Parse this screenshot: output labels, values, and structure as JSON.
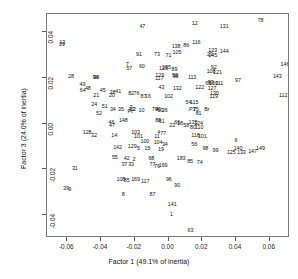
{
  "chart_data": {
    "type": "scatter",
    "title": "",
    "xlabel": "Factor 1 (49.1% of inertia)",
    "ylabel": "Factor 3 (24.0% of inertia)",
    "xlim": [
      -0.072,
      0.072
    ],
    "ylim": [
      -0.05,
      0.048
    ],
    "xticks": [
      "-0.06",
      "-0.04",
      "-0.02",
      "0.00",
      "0.02",
      "0.04",
      "0.06"
    ],
    "xtick_values": [
      -0.06,
      -0.04,
      -0.02,
      0.0,
      0.02,
      0.04,
      0.06
    ],
    "yticks": [
      "0.04",
      "0.02",
      "0.00",
      "-0.02",
      "-0.04"
    ],
    "ytick_values": [
      0.04,
      0.02,
      0.0,
      -0.02,
      -0.04
    ],
    "grid": false,
    "legend": "none",
    "marker": "text-label",
    "points": [
      {
        "label": "78",
        "x": 0.0545,
        "y": 0.045
      },
      {
        "label": "12",
        "x": 0.0155,
        "y": 0.0435
      },
      {
        "label": "131",
        "x": 0.033,
        "y": 0.0425
      },
      {
        "label": "47",
        "x": -0.0155,
        "y": 0.0425
      },
      {
        "label": "13",
        "x": -0.063,
        "y": 0.0355
      },
      {
        "label": "29",
        "x": -0.0632,
        "y": 0.0345
      },
      {
        "label": "116",
        "x": 0.0165,
        "y": 0.0355
      },
      {
        "label": "86",
        "x": 0.0105,
        "y": 0.034
      },
      {
        "label": "138",
        "x": 0.0045,
        "y": 0.0335
      },
      {
        "label": "105",
        "x": 0.005,
        "y": 0.031
      },
      {
        "label": "123",
        "x": 0.0262,
        "y": 0.032
      },
      {
        "label": "144",
        "x": 0.033,
        "y": 0.0315
      },
      {
        "label": "23",
        "x": 0.0245,
        "y": 0.03
      },
      {
        "label": "145",
        "x": 0.0262,
        "y": 0.0298
      },
      {
        "label": "91",
        "x": -0.0175,
        "y": 0.03
      },
      {
        "label": "73",
        "x": -0.0068,
        "y": 0.03
      },
      {
        "label": "71",
        "x": 0.0,
        "y": 0.0298
      },
      {
        "label": "146",
        "x": 0.069,
        "y": 0.0255
      },
      {
        "label": "7",
        "x": -0.0245,
        "y": 0.0255
      },
      {
        "label": "60",
        "x": -0.0158,
        "y": 0.025
      },
      {
        "label": "57",
        "x": -0.0232,
        "y": 0.0238
      },
      {
        "label": "125",
        "x": -0.003,
        "y": 0.0238
      },
      {
        "label": "135",
        "x": -0.0012,
        "y": 0.0245
      },
      {
        "label": "89",
        "x": 0.0035,
        "y": 0.0235
      },
      {
        "label": "92",
        "x": 0.0268,
        "y": 0.0242
      },
      {
        "label": "108",
        "x": 0.0252,
        "y": 0.0228
      },
      {
        "label": "121",
        "x": 0.029,
        "y": 0.022
      },
      {
        "label": "28",
        "x": -0.0578,
        "y": 0.0205
      },
      {
        "label": "143",
        "x": 0.0645,
        "y": 0.0205
      },
      {
        "label": "129",
        "x": -0.0052,
        "y": 0.0208
      },
      {
        "label": "117",
        "x": -0.0055,
        "y": 0.0195
      },
      {
        "label": "98",
        "x": 0.0042,
        "y": 0.0205
      },
      {
        "label": "50",
        "x": 0.0038,
        "y": 0.0208
      },
      {
        "label": "113",
        "x": 0.014,
        "y": 0.02
      },
      {
        "label": "97",
        "x": 0.0412,
        "y": 0.0188
      },
      {
        "label": "94",
        "x": -0.0428,
        "y": 0.02
      },
      {
        "label": "96",
        "x": -0.0432,
        "y": 0.0198
      },
      {
        "label": "49",
        "x": -0.051,
        "y": 0.017
      },
      {
        "label": "65",
        "x": 0.0235,
        "y": 0.0175
      },
      {
        "label": "93",
        "x": 0.025,
        "y": 0.0178
      },
      {
        "label": "150",
        "x": 0.0268,
        "y": 0.0172
      },
      {
        "label": "111",
        "x": 0.03,
        "y": 0.0172
      },
      {
        "label": "48",
        "x": -0.0478,
        "y": 0.0152
      },
      {
        "label": "64",
        "x": -0.0508,
        "y": 0.0145
      },
      {
        "label": "45",
        "x": -0.039,
        "y": 0.0145
      },
      {
        "label": "43",
        "x": -0.0042,
        "y": 0.0158
      },
      {
        "label": "132",
        "x": 0.0052,
        "y": 0.015
      },
      {
        "label": "127",
        "x": 0.0258,
        "y": 0.0152
      },
      {
        "label": "122",
        "x": 0.0185,
        "y": 0.0155
      },
      {
        "label": "112",
        "x": 0.068,
        "y": 0.0122
      },
      {
        "label": "38",
        "x": -0.0332,
        "y": 0.0135
      },
      {
        "label": "41",
        "x": -0.0298,
        "y": 0.0138
      },
      {
        "label": "20",
        "x": -0.0335,
        "y": 0.0122
      },
      {
        "label": "21",
        "x": -0.0428,
        "y": 0.0122
      },
      {
        "label": "82",
        "x": -0.0222,
        "y": 0.013
      },
      {
        "label": "76",
        "x": -0.019,
        "y": 0.0128
      },
      {
        "label": "87",
        "x": -0.0148,
        "y": 0.0118
      },
      {
        "label": "16",
        "x": -0.0122,
        "y": 0.0115
      },
      {
        "label": "102",
        "x": 0.0,
        "y": 0.0115
      },
      {
        "label": "130",
        "x": 0.0272,
        "y": 0.0128
      },
      {
        "label": "119",
        "x": 0.0268,
        "y": 0.0118
      },
      {
        "label": "54",
        "x": 0.0118,
        "y": 0.0092
      },
      {
        "label": "115",
        "x": 0.0152,
        "y": 0.009
      },
      {
        "label": "24",
        "x": -0.044,
        "y": 0.0082
      },
      {
        "label": "51",
        "x": -0.0378,
        "y": 0.0072
      },
      {
        "label": "34",
        "x": -0.033,
        "y": 0.0058
      },
      {
        "label": "35",
        "x": -0.0282,
        "y": 0.0058
      },
      {
        "label": "3",
        "x": -0.0222,
        "y": 0.007
      },
      {
        "label": "32",
        "x": -0.0218,
        "y": 0.0062
      },
      {
        "label": "2",
        "x": -0.0202,
        "y": 0.006
      },
      {
        "label": "Pt",
        "x": -0.0228,
        "y": 0.0052
      },
      {
        "label": "10",
        "x": -0.016,
        "y": 0.0055
      },
      {
        "label": "79",
        "x": -0.0082,
        "y": 0.0058
      },
      {
        "label": "40",
        "x": -0.0062,
        "y": 0.0058
      },
      {
        "label": "50b",
        "x": -0.0048,
        "y": 0.0055
      },
      {
        "label": "26",
        "x": -0.0022,
        "y": 0.0055
      },
      {
        "label": "P3",
        "x": 0.014,
        "y": 0.0058
      },
      {
        "label": "75",
        "x": 0.0162,
        "y": 0.006
      },
      {
        "label": "Br",
        "x": 0.0228,
        "y": 0.0062
      },
      {
        "label": "81",
        "x": 0.0178,
        "y": 0.0042
      },
      {
        "label": "52",
        "x": -0.0412,
        "y": 0.0042
      },
      {
        "label": "46",
        "x": -0.0338,
        "y": 0.0005
      },
      {
        "label": "148",
        "x": -0.0268,
        "y": 0.0012
      },
      {
        "label": "88",
        "x": -0.0062,
        "y": 0.0012
      },
      {
        "label": "61",
        "x": -0.004,
        "y": 0.0008
      },
      {
        "label": "66",
        "x": 0.0052,
        "y": 0.0002
      },
      {
        "label": "18",
        "x": 0.0068,
        "y": 0.0
      },
      {
        "label": "135b",
        "x": 0.0145,
        "y": 0.0002
      },
      {
        "label": "124",
        "x": 0.0178,
        "y": -0.0002
      },
      {
        "label": "22",
        "x": 0.0022,
        "y": -0.001
      },
      {
        "label": "58",
        "x": 0.0105,
        "y": -0.0012
      },
      {
        "label": "80",
        "x": 0.0145,
        "y": -0.0018
      },
      {
        "label": "110",
        "x": 0.0182,
        "y": -0.002
      },
      {
        "label": "47b",
        "x": -0.0335,
        "y": -0.001
      },
      {
        "label": "128",
        "x": -0.0482,
        "y": -0.0042
      },
      {
        "label": "32b",
        "x": -0.0442,
        "y": -0.0052
      },
      {
        "label": "14",
        "x": -0.0322,
        "y": -0.0055
      },
      {
        "label": "103",
        "x": -0.0195,
        "y": -0.0042
      },
      {
        "label": "101",
        "x": -0.0178,
        "y": -0.0058
      },
      {
        "label": "4",
        "x": -0.0058,
        "y": -0.0042
      },
      {
        "label": "77",
        "x": -0.0032,
        "y": -0.0045
      },
      {
        "label": "11",
        "x": -0.0068,
        "y": -0.006
      },
      {
        "label": "118",
        "x": 0.016,
        "y": -0.0052
      },
      {
        "label": "101b",
        "x": 0.02,
        "y": -0.006
      },
      {
        "label": "6",
        "x": 0.04,
        "y": -0.0075
      },
      {
        "label": "100",
        "x": -0.014,
        "y": -0.0082
      },
      {
        "label": "104",
        "x": -0.0062,
        "y": -0.0085
      },
      {
        "label": "34b",
        "x": -0.0022,
        "y": -0.0092
      },
      {
        "label": "56",
        "x": 0.0152,
        "y": -0.0095
      },
      {
        "label": "142",
        "x": -0.0302,
        "y": -0.0105
      },
      {
        "label": "129b",
        "x": -0.0215,
        "y": -0.0102
      },
      {
        "label": "5",
        "x": -0.0178,
        "y": -0.0112
      },
      {
        "label": "15",
        "x": -0.0125,
        "y": -0.0112
      },
      {
        "label": "19",
        "x": -0.0045,
        "y": -0.0115
      },
      {
        "label": "98b",
        "x": 0.0218,
        "y": -0.0112
      },
      {
        "label": "99",
        "x": 0.0278,
        "y": -0.0118
      },
      {
        "label": "140",
        "x": 0.0412,
        "y": -0.0112
      },
      {
        "label": "149",
        "x": 0.0545,
        "y": -0.0112
      },
      {
        "label": "147",
        "x": 0.0498,
        "y": -0.0122
      },
      {
        "label": "125b",
        "x": 0.0372,
        "y": -0.013
      },
      {
        "label": "133",
        "x": 0.0432,
        "y": -0.0128
      },
      {
        "label": "55",
        "x": -0.0318,
        "y": -0.0152
      },
      {
        "label": "42",
        "x": -0.0248,
        "y": -0.0155
      },
      {
        "label": "2b",
        "x": -0.0205,
        "y": -0.0158
      },
      {
        "label": "68",
        "x": -0.0102,
        "y": -0.0155
      },
      {
        "label": "183",
        "x": 0.0075,
        "y": -0.0155
      },
      {
        "label": "85",
        "x": 0.0128,
        "y": -0.0168
      },
      {
        "label": "74",
        "x": 0.0185,
        "y": -0.0172
      },
      {
        "label": "37",
        "x": -0.0262,
        "y": -0.0182
      },
      {
        "label": "33",
        "x": -0.0222,
        "y": -0.0182
      },
      {
        "label": "77b",
        "x": -0.0095,
        "y": -0.0182
      },
      {
        "label": "76b",
        "x": -0.0068,
        "y": -0.0188
      },
      {
        "label": "169",
        "x": -0.0032,
        "y": -0.0185
      },
      {
        "label": "31",
        "x": -0.0555,
        "y": -0.0198
      },
      {
        "label": "108b",
        "x": -0.0282,
        "y": -0.0248
      },
      {
        "label": "85b",
        "x": -0.0248,
        "y": -0.0252
      },
      {
        "label": "169b",
        "x": -0.0195,
        "y": -0.0248
      },
      {
        "label": "117b",
        "x": -0.0138,
        "y": -0.0255
      },
      {
        "label": "96b",
        "x": 0.0002,
        "y": -0.0248
      },
      {
        "label": "90",
        "x": 0.0052,
        "y": -0.0272
      },
      {
        "label": "39",
        "x": -0.0608,
        "y": -0.0285
      },
      {
        "label": "9",
        "x": -0.0585,
        "y": -0.0292
      },
      {
        "label": "8",
        "x": -0.0268,
        "y": -0.0312
      },
      {
        "label": "87b",
        "x": -0.0095,
        "y": -0.0312
      },
      {
        "label": "141",
        "x": 0.0022,
        "y": -0.0355
      },
      {
        "label": "1",
        "x": 0.0018,
        "y": -0.0398
      },
      {
        "label": "63",
        "x": 0.013,
        "y": -0.0468
      }
    ]
  },
  "axes": {
    "x_title": "Factor 1 (49.1% of inertia)",
    "y_title": "Factor 3 (24.0% of inertia)"
  }
}
